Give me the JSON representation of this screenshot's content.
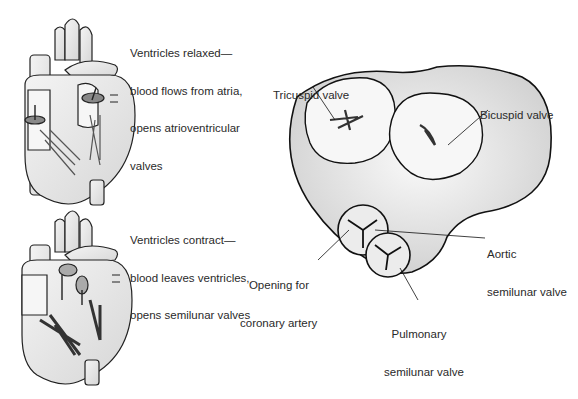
{
  "top_heart": {
    "caption_lines": [
      "Ventricles relaxed—",
      "blood flows from atria,",
      "opens atrioventricular",
      "valves"
    ]
  },
  "bottom_heart": {
    "caption_lines": [
      "Ventricles contract—",
      "blood leaves ventricles,",
      "opens semilunar valves"
    ]
  },
  "valve_diagram": {
    "labels": {
      "tricuspid": "Tricuspid valve",
      "bicuspid": "Bicuspid valve",
      "aortic": [
        "Aortic",
        "semilunar valve"
      ],
      "coronary": [
        "Opening for",
        "coronary artery"
      ],
      "pulmonary": [
        "Pulmonary",
        "semilunar valve"
      ]
    }
  }
}
